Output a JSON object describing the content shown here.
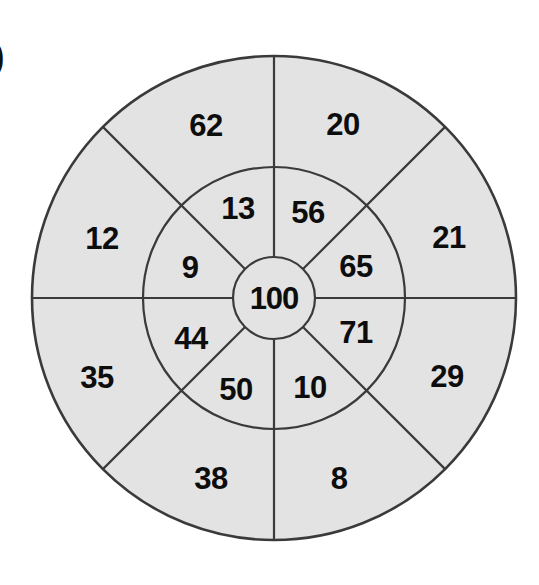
{
  "page": {
    "item_marker": ")",
    "background_color": "#ffffff"
  },
  "style": {
    "fill_color": "#e3e3e3",
    "stroke_color": "#3a3a3a",
    "text_color": "#0d0d0d",
    "outer_stroke_width": 2.6,
    "divider_stroke_width": 2.2
  },
  "geometry": {
    "center_x": 274,
    "center_y": 298,
    "outer_radius": 242,
    "middle_radius": 131,
    "inner_radius": 41,
    "sector_count": 8,
    "sector_angle_deg": 45
  },
  "chart_data": {
    "type": "pie",
    "title": "",
    "subtitle": "",
    "xlabel": "",
    "ylabel": "",
    "legend_position": "none",
    "grid": false,
    "rings": [
      {
        "name": "center",
        "radius": 41,
        "inner_radius": 0,
        "sector_count": 1,
        "values": [
          100
        ],
        "sectors": [
          {
            "label": "100",
            "value": 100,
            "start_deg": 0,
            "end_deg": 360,
            "mid_deg": 0,
            "label_x": 274,
            "label_y": 298
          }
        ]
      },
      {
        "name": "middle",
        "radius": 131,
        "inner_radius": 41,
        "sector_count": 8,
        "values": [
          56,
          65,
          71,
          10,
          50,
          44,
          9,
          13
        ],
        "sectors": [
          {
            "label": "56",
            "value": 56,
            "start_deg": -90,
            "end_deg": -45,
            "mid_deg": -67.5,
            "label_x": 308,
            "label_y": 212
          },
          {
            "label": "65",
            "value": 65,
            "start_deg": -45,
            "end_deg": 0,
            "mid_deg": -22.5,
            "label_x": 356,
            "label_y": 266
          },
          {
            "label": "71",
            "value": 71,
            "start_deg": 0,
            "end_deg": 45,
            "mid_deg": 22.5,
            "label_x": 356,
            "label_y": 332
          },
          {
            "label": "10",
            "value": 10,
            "start_deg": 45,
            "end_deg": 90,
            "mid_deg": 67.5,
            "label_x": 310,
            "label_y": 387
          },
          {
            "label": "50",
            "value": 50,
            "start_deg": 90,
            "end_deg": 135,
            "mid_deg": 112.5,
            "label_x": 236,
            "label_y": 389
          },
          {
            "label": "44",
            "value": 44,
            "start_deg": 135,
            "end_deg": 180,
            "mid_deg": 157.5,
            "label_x": 191,
            "label_y": 338
          },
          {
            "label": "9",
            "value": 9,
            "start_deg": 180,
            "end_deg": 225,
            "mid_deg": 202.5,
            "label_x": 190,
            "label_y": 267
          },
          {
            "label": "13",
            "value": 13,
            "start_deg": 225,
            "end_deg": 270,
            "mid_deg": 247.5,
            "label_x": 238,
            "label_y": 208
          }
        ]
      },
      {
        "name": "outer",
        "radius": 242,
        "inner_radius": 131,
        "sector_count": 8,
        "values": [
          20,
          21,
          29,
          8,
          38,
          35,
          12,
          62
        ],
        "sectors": [
          {
            "label": "20",
            "value": 20,
            "start_deg": -90,
            "end_deg": -45,
            "mid_deg": -67.5,
            "label_x": 343,
            "label_y": 124
          },
          {
            "label": "21",
            "value": 21,
            "start_deg": -45,
            "end_deg": 0,
            "mid_deg": -22.5,
            "label_x": 449,
            "label_y": 237
          },
          {
            "label": "29",
            "value": 29,
            "start_deg": 0,
            "end_deg": 45,
            "mid_deg": 22.5,
            "label_x": 447,
            "label_y": 376
          },
          {
            "label": "8",
            "value": 8,
            "start_deg": 45,
            "end_deg": 90,
            "mid_deg": 67.5,
            "label_x": 339,
            "label_y": 478
          },
          {
            "label": "38",
            "value": 38,
            "start_deg": 90,
            "end_deg": 135,
            "mid_deg": 112.5,
            "label_x": 211,
            "label_y": 478
          },
          {
            "label": "35",
            "value": 35,
            "start_deg": 135,
            "end_deg": 180,
            "mid_deg": 157.5,
            "label_x": 97,
            "label_y": 377
          },
          {
            "label": "12",
            "value": 12,
            "start_deg": 180,
            "end_deg": 225,
            "mid_deg": 202.5,
            "label_x": 102,
            "label_y": 238
          },
          {
            "label": "62",
            "value": 62,
            "start_deg": 225,
            "end_deg": 270,
            "mid_deg": 247.5,
            "label_x": 206,
            "label_y": 125
          }
        ]
      }
    ]
  }
}
